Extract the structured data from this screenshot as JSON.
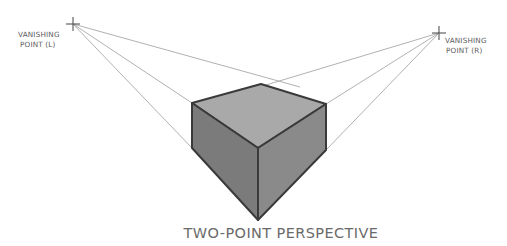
{
  "diagram": {
    "title": "TWO-POINT PERSPECTIVE",
    "vanishing_point_left": {
      "line1": "VANISHING",
      "line2": "POINT (L)"
    },
    "vanishing_point_right": {
      "line1": "VANISHING",
      "line2": "POINT (R)"
    },
    "colors": {
      "top_face": "#a9a9a9",
      "left_face": "#7b7b7b",
      "right_face": "#8a8a8a",
      "edges": "#3a3a3a",
      "guide_lines": "#a8a8a8"
    }
  }
}
